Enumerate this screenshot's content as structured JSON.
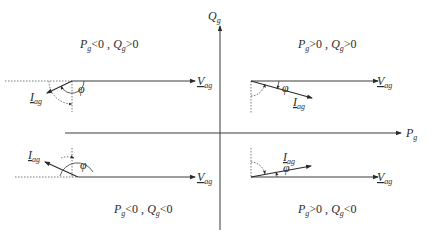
{
  "axes": {
    "horizontal": {
      "symbol": "P",
      "subscript": "g"
    },
    "vertical": {
      "symbol": "Q",
      "subscript": "g"
    }
  },
  "quadrants": [
    {
      "id": "q-top-left",
      "condition": {
        "p_symbol": "P",
        "p_sub": "g",
        "p_rel": "<0 , ",
        "q_symbol": "Q",
        "q_sub": "g",
        "q_rel": ">0"
      },
      "voltage_label": {
        "symbol": "V",
        "subscript": "ag"
      },
      "current_label": {
        "symbol": "I",
        "subscript": "ag"
      },
      "angle_label": "φ"
    },
    {
      "id": "q-top-right",
      "condition": {
        "p_symbol": "P",
        "p_sub": "g",
        "p_rel": ">0 , ",
        "q_symbol": "Q",
        "q_sub": "g",
        "q_rel": ">0"
      },
      "voltage_label": {
        "symbol": "V",
        "subscript": "ag"
      },
      "current_label": {
        "symbol": "I",
        "subscript": "ag"
      },
      "angle_label": "φ"
    },
    {
      "id": "q-bottom-left",
      "condition": {
        "p_symbol": "P",
        "p_sub": "g",
        "p_rel": "<0 , ",
        "q_symbol": "Q",
        "q_sub": "g",
        "q_rel": "<0"
      },
      "voltage_label": {
        "symbol": "V",
        "subscript": "ag"
      },
      "current_label": {
        "symbol": "I",
        "subscript": "ag"
      },
      "angle_label": "φ"
    },
    {
      "id": "q-bottom-right",
      "condition": {
        "p_symbol": "P",
        "p_sub": "g",
        "p_rel": ">0 , ",
        "q_symbol": "Q",
        "q_sub": "g",
        "q_rel": "<0"
      },
      "voltage_label": {
        "symbol": "V",
        "subscript": "ag"
      },
      "current_label": {
        "symbol": "I",
        "subscript": "ag"
      },
      "angle_label": "φ"
    }
  ],
  "colors": {
    "line": "#3a3a3a",
    "dashed": "#555555",
    "text": "#2a2a2a"
  }
}
